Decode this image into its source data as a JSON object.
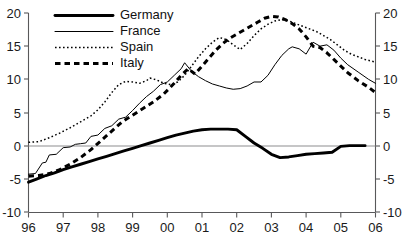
{
  "chart_data": {
    "type": "line",
    "title": "",
    "subtitle": "",
    "xlabel": "",
    "ylabel": "",
    "ylim": [
      -10,
      20
    ],
    "yticks": [
      20,
      15,
      10,
      5,
      0,
      -5,
      -10
    ],
    "ytick_labels": [
      "20",
      "15",
      "10",
      "5",
      "0",
      "-5",
      "-10"
    ],
    "right_axis": true,
    "right_ytick_labels": [
      "20",
      "15",
      "10",
      "5",
      "0",
      "-5",
      "-10"
    ],
    "grid": false,
    "zero_line": true,
    "legend_position": "top-left",
    "x": [
      96,
      97,
      98,
      99,
      100,
      101,
      102,
      103,
      104,
      105,
      106
    ],
    "xtick_labels": [
      "96",
      "97",
      "98",
      "99",
      "00",
      "01",
      "02",
      "03",
      "04",
      "05",
      "06"
    ],
    "xlim": [
      96,
      106
    ],
    "series": [
      {
        "name": "Germany",
        "style": "thick-solid",
        "color": "#000000",
        "x": [
          96.0,
          96.25,
          96.5,
          96.75,
          97.0,
          97.25,
          97.5,
          97.75,
          98.0,
          98.25,
          98.5,
          98.75,
          99.0,
          99.25,
          99.5,
          99.75,
          100.0,
          100.25,
          100.5,
          100.75,
          101.0,
          101.25,
          101.5,
          101.75,
          102.0,
          102.25,
          102.5,
          102.75,
          103.0,
          103.25,
          103.5,
          103.75,
          104.0,
          104.25,
          104.5,
          104.75,
          105.0,
          105.25,
          105.5,
          105.7
        ],
        "values": [
          -5.5,
          -5.0,
          -4.5,
          -4.1,
          -3.6,
          -3.2,
          -2.8,
          -2.4,
          -2.0,
          -1.6,
          -1.2,
          -0.8,
          -0.4,
          0.0,
          0.4,
          0.8,
          1.2,
          1.6,
          1.9,
          2.2,
          2.4,
          2.5,
          2.5,
          2.5,
          2.4,
          1.4,
          0.4,
          -0.4,
          -1.3,
          -1.8,
          -1.7,
          -1.5,
          -1.3,
          -1.2,
          -1.1,
          -1.0,
          -0.1,
          0.0,
          0.0,
          0.0
        ]
      },
      {
        "name": "France",
        "style": "thin-solid",
        "color": "#000000",
        "x": [
          96.0,
          96.2,
          96.4,
          96.5,
          96.6,
          96.8,
          97.0,
          97.2,
          97.35,
          97.5,
          97.65,
          97.8,
          98.0,
          98.2,
          98.4,
          98.6,
          98.8,
          99.0,
          99.2,
          99.4,
          99.6,
          99.8,
          100.0,
          100.2,
          100.4,
          100.5,
          100.7,
          100.9,
          101.1,
          101.3,
          101.5,
          101.7,
          101.9,
          102.1,
          102.3,
          102.5,
          102.7,
          102.9,
          103.1,
          103.3,
          103.5,
          103.6,
          103.8,
          104.0,
          104.2,
          104.4,
          104.6,
          104.8,
          105.0,
          105.2,
          105.5,
          105.8,
          106.0
        ],
        "values": [
          -4.3,
          -4.2,
          -2.6,
          -2.5,
          -1.4,
          -1.3,
          -0.3,
          -0.2,
          0.2,
          0.3,
          0.4,
          1.4,
          1.6,
          2.6,
          3.0,
          4.0,
          4.3,
          5.3,
          6.4,
          7.4,
          8.2,
          9.2,
          9.6,
          10.6,
          11.6,
          12.5,
          11.2,
          10.4,
          9.8,
          9.3,
          9.0,
          8.7,
          8.5,
          8.6,
          9.0,
          9.6,
          9.6,
          10.6,
          12.2,
          13.6,
          14.6,
          14.9,
          14.6,
          13.8,
          15.6,
          15.0,
          15.2,
          14.4,
          13.2,
          12.2,
          11.1,
          10.0,
          9.4
        ]
      },
      {
        "name": "Spain",
        "style": "dotted",
        "color": "#000000",
        "x": [
          96.0,
          96.3,
          96.6,
          96.9,
          97.2,
          97.5,
          97.8,
          98.0,
          98.2,
          98.4,
          98.6,
          98.8,
          99.0,
          99.2,
          99.4,
          99.5,
          99.7,
          99.9,
          100.1,
          100.3,
          100.5,
          100.7,
          100.9,
          101.1,
          101.3,
          101.5,
          101.7,
          101.9,
          102.1,
          102.3,
          102.5,
          102.7,
          102.9,
          103.1,
          103.3,
          103.5,
          103.7,
          103.9,
          104.1,
          104.3,
          104.5,
          104.7,
          104.9,
          105.1,
          105.3,
          105.5,
          105.7,
          106.0
        ],
        "values": [
          0.5,
          0.6,
          1.2,
          1.9,
          2.7,
          3.6,
          4.5,
          5.4,
          6.6,
          8.0,
          9.2,
          9.7,
          9.6,
          9.4,
          9.8,
          10.2,
          9.9,
          9.4,
          9.2,
          9.6,
          10.6,
          12.0,
          13.4,
          14.6,
          15.6,
          16.3,
          16.0,
          15.2,
          14.5,
          15.4,
          16.6,
          17.6,
          18.3,
          18.8,
          19.0,
          18.8,
          18.4,
          18.0,
          17.6,
          17.2,
          16.6,
          16.0,
          15.2,
          14.4,
          13.8,
          13.4,
          13.0,
          12.6
        ]
      },
      {
        "name": "Italy",
        "style": "thick-dashed",
        "color": "#000000",
        "x": [
          96.0,
          96.3,
          96.6,
          96.9,
          97.2,
          97.5,
          97.8,
          98.1,
          98.4,
          98.7,
          99.0,
          99.3,
          99.6,
          99.9,
          100.2,
          100.4,
          100.6,
          100.8,
          101.0,
          101.2,
          101.4,
          101.6,
          101.8,
          102.0,
          102.2,
          102.4,
          102.6,
          102.8,
          103.0,
          103.2,
          103.4,
          103.6,
          103.8,
          104.0,
          104.2,
          104.4,
          104.6,
          104.8,
          105.0,
          105.2,
          105.5,
          105.8,
          106.0
        ],
        "values": [
          -4.6,
          -4.5,
          -4.2,
          -3.6,
          -2.8,
          -1.8,
          -0.6,
          0.8,
          2.2,
          3.6,
          4.6,
          5.6,
          6.6,
          7.8,
          9.4,
          10.6,
          11.6,
          10.8,
          12.0,
          13.2,
          14.4,
          15.4,
          16.2,
          16.8,
          17.4,
          18.0,
          18.6,
          19.2,
          19.5,
          19.4,
          19.0,
          18.4,
          17.6,
          16.4,
          15.0,
          14.8,
          14.0,
          13.0,
          12.0,
          11.0,
          9.8,
          8.8,
          8.0
        ]
      }
    ]
  },
  "legend": {
    "entries": [
      {
        "label": "Germany",
        "style": "thick-solid"
      },
      {
        "label": "France",
        "style": "thin-solid"
      },
      {
        "label": "Spain",
        "style": "dotted"
      },
      {
        "label": "Italy",
        "style": "thick-dashed"
      }
    ]
  }
}
